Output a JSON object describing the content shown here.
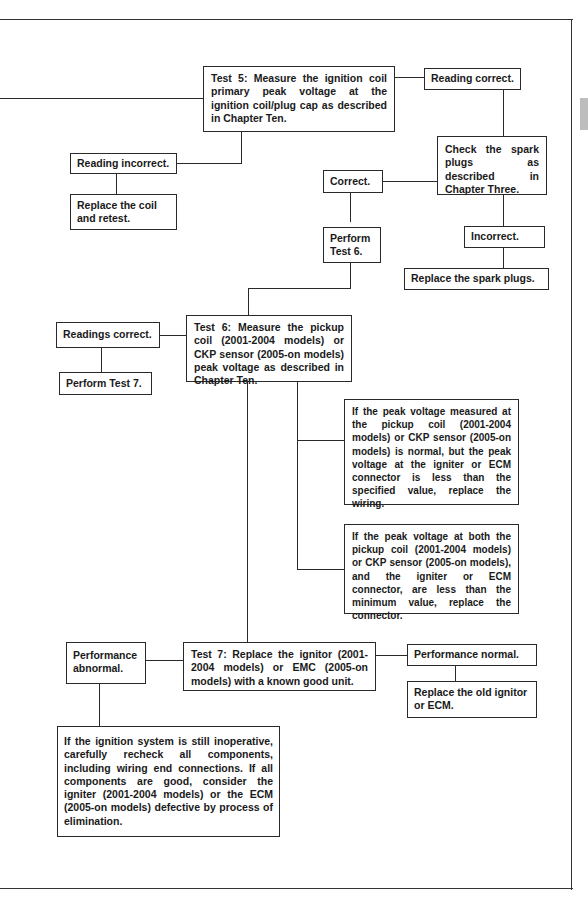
{
  "page": {
    "side_tab_color": "#bdbdbd",
    "line_color": "#2a2a2a"
  },
  "flowchart": {
    "test5": "Test 5: Measure the ignition coil primary peak voltage at the ignition coil/plug cap as described in Chapter Ten.",
    "test5_reading_correct": "Reading correct.",
    "test5_reading_incorrect": "Reading incorrect.",
    "replace_coil": "Replace the coil and retest.",
    "check_spark_plugs": "Check the spark plugs as described in Chapter Three.",
    "plugs_correct": "Correct.",
    "plugs_incorrect": "Incorrect.",
    "replace_spark_plugs": "Replace the spark plugs.",
    "perform_test6": "Perform Test 6.",
    "test6": "Test 6: Measure the pickup coil (2001-2004 models) or CKP sensor (2005-on models) peak voltage as described in Chapter Ten.",
    "test6_readings_correct": "Readings correct.",
    "perform_test7": "Perform Test 7.",
    "test6_note_wiring": "If the peak voltage measured at the pickup coil (2001-2004 models) or CKP sensor (2005-on models) is normal, but the peak voltage at the igniter or ECM connector is less than the specified value, replace the wiring.",
    "test6_note_connector": "If the peak voltage at both the pickup coil (2001-2004 models) or CKP sensor (2005-on models), and the igniter or ECM connector, are less than the minimum value, replace the connector.",
    "test7": "Test 7: Replace the ignitor (2001-2004 models) or EMC (2005-on models) with a known good unit.",
    "test7_performance_abnormal": "Performance abnormal.",
    "test7_performance_normal": "Performance normal.",
    "replace_old_ignitor": "Replace the old ignitor or ECM.",
    "final_note": "If the ignition system is still inoperative, carefully recheck all components, including wiring end connections. If all components are good, consider the igniter (2001-2004 models) or the ECM (2005-on models) defective by process of elimination."
  }
}
